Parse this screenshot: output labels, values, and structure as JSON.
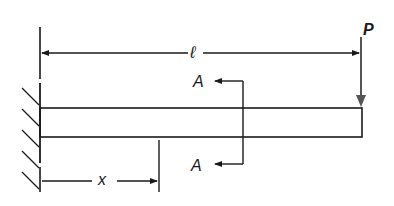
{
  "diagram": {
    "type": "cantilever-beam",
    "labels": {
      "length": "ℓ",
      "load": "P",
      "section_top": "A",
      "section_bottom": "A",
      "distance": "x"
    },
    "colors": {
      "line": "#1a1a1a",
      "load_arrow": "#555555",
      "background": "#ffffff"
    }
  }
}
